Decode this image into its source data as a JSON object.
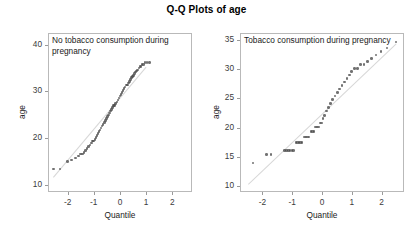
{
  "figure": {
    "title": "Q-Q Plots of age",
    "width": 413,
    "height": 235
  },
  "chart_data": [
    {
      "type": "scatter",
      "title": "Q-Q Plots of age",
      "panel_label": "No tobacco consumption during pregnancy",
      "xlabel": "Quantile",
      "ylabel": "age",
      "xlim": [
        -2.75,
        2.75
      ],
      "ylim": [
        8.5,
        42.5
      ],
      "xticks": [
        -2,
        -1,
        0,
        1,
        2
      ],
      "xtick_labels": [
        "-2",
        "-1",
        "0",
        "1",
        "2"
      ],
      "yticks": [
        10,
        20,
        30,
        40
      ],
      "ytick_labels": [
        "10",
        "20",
        "30",
        "40"
      ],
      "grid": false,
      "legend": "none",
      "reference_line": {
        "x": [
          -2.6,
          0.95
        ],
        "y": [
          12.0,
          35.6
        ]
      },
      "x": [
        -2.58,
        -2.33,
        -2.05,
        -1.88,
        -1.74,
        -1.62,
        -1.54,
        -1.48,
        -1.42,
        -1.36,
        -1.3,
        -1.24,
        -1.18,
        -1.12,
        -1.08,
        -1.04,
        -1.0,
        -0.96,
        -0.92,
        -0.88,
        -0.84,
        -0.8,
        -0.76,
        -0.72,
        -0.68,
        -0.64,
        -0.6,
        -0.56,
        -0.52,
        -0.48,
        -0.44,
        -0.4,
        -0.36,
        -0.32,
        -0.28,
        -0.24,
        -0.2,
        -0.16,
        -0.12,
        -0.08,
        -0.04,
        0.0,
        0.04,
        0.08,
        0.12,
        0.16,
        0.2,
        0.24,
        0.28,
        0.32,
        0.36,
        0.4,
        0.44,
        0.48,
        0.52,
        0.56,
        0.6,
        0.64,
        0.68,
        0.72,
        0.76,
        0.8,
        0.86,
        0.92,
        1.0,
        1.08
      ],
      "y": [
        13.6,
        13.6,
        15.2,
        15.6,
        16.0,
        16.4,
        16.8,
        16.8,
        17.2,
        17.6,
        18.0,
        18.4,
        18.8,
        19.2,
        19.6,
        19.6,
        20.0,
        20.4,
        20.8,
        21.2,
        21.6,
        22.0,
        22.4,
        22.8,
        23.2,
        23.6,
        24.0,
        24.4,
        24.8,
        25.2,
        25.6,
        26.0,
        26.4,
        26.8,
        27.2,
        27.2,
        27.6,
        28.0,
        28.4,
        28.8,
        29.2,
        29.6,
        30.0,
        30.4,
        30.8,
        31.2,
        31.6,
        31.6,
        32.0,
        32.4,
        32.8,
        33.2,
        33.4,
        33.6,
        34.0,
        34.4,
        34.6,
        34.8,
        35.2,
        35.6,
        35.6,
        36.0,
        36.0,
        36.4,
        36.4,
        36.4
      ]
    },
    {
      "type": "scatter",
      "title": "Q-Q Plots of age",
      "panel_label": "Tobacco consumption during pregnancy",
      "xlabel": "Quantile",
      "ylabel": "age",
      "xlim": [
        -2.75,
        2.75
      ],
      "ylim": [
        9.0,
        36.2
      ],
      "xticks": [
        -2,
        -1,
        0,
        1,
        2
      ],
      "xtick_labels": [
        "-2",
        "-1",
        "0",
        "1",
        "2"
      ],
      "yticks": [
        10,
        15,
        20,
        25,
        30,
        35
      ],
      "ytick_labels": [
        "10",
        "15",
        "20",
        "25",
        "30",
        "35"
      ],
      "grid": false,
      "legend": "none",
      "reference_line": {
        "x": [
          -2.5,
          2.45
        ],
        "y": [
          10.6,
          34.6
        ]
      },
      "x": [
        -2.35,
        -1.9,
        -1.75,
        -1.3,
        -1.22,
        -1.16,
        -1.1,
        -1.04,
        -0.98,
        -0.9,
        -0.85,
        -0.8,
        -0.75,
        -0.7,
        -0.62,
        -0.57,
        -0.52,
        -0.47,
        -0.4,
        -0.35,
        -0.3,
        -0.25,
        -0.2,
        -0.15,
        -0.1,
        -0.05,
        0.0,
        0.06,
        0.12,
        0.18,
        0.25,
        0.32,
        0.4,
        0.48,
        0.56,
        0.64,
        0.72,
        0.8,
        0.88,
        0.96,
        1.05,
        1.15,
        1.26,
        1.38,
        1.5,
        1.62,
        1.78,
        1.95,
        2.15,
        2.45
      ],
      "y": [
        14.1,
        15.6,
        15.6,
        16.3,
        16.3,
        16.3,
        16.3,
        16.3,
        16.3,
        17.6,
        17.6,
        17.6,
        17.6,
        17.6,
        18.6,
        18.6,
        18.6,
        18.6,
        19.5,
        19.5,
        19.5,
        20.3,
        20.3,
        20.3,
        21.0,
        21.0,
        21.7,
        22.3,
        23.0,
        23.6,
        24.3,
        25.0,
        25.6,
        26.2,
        26.8,
        27.4,
        28.0,
        28.6,
        29.2,
        29.8,
        30.3,
        30.3,
        31.0,
        31.0,
        31.5,
        32.0,
        32.6,
        33.2,
        33.8,
        34.8
      ]
    }
  ],
  "panels": [
    {
      "name": "left",
      "label": "No tobacco consumption during pregnancy",
      "ylabel": "age",
      "xlabel": "Quantile"
    },
    {
      "name": "right",
      "label": "Tobacco consumption during pregnancy",
      "ylabel": "age",
      "xlabel": "Quantile"
    }
  ]
}
